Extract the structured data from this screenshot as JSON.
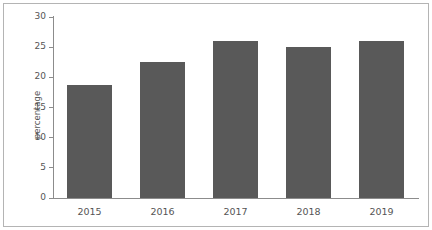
{
  "chart_data": {
    "type": "bar",
    "title": "",
    "subtitle": "",
    "xlabel": "",
    "ylabel": "percentage",
    "categories": [
      "2015",
      "2016",
      "2017",
      "2018",
      "2019"
    ],
    "values": [
      18.8,
      22.6,
      26.0,
      25.1,
      26.0
    ],
    "series": [
      {
        "name": "percentage",
        "values": [
          18.8,
          22.6,
          26.0,
          25.1,
          26.0
        ]
      }
    ],
    "ylim": [
      0,
      30
    ],
    "yticks": [
      0,
      5,
      10,
      15,
      20,
      25,
      30
    ],
    "ytick_labels": [
      "0",
      "5",
      "10",
      "15",
      "20",
      "25",
      "30"
    ],
    "xtick_labels": [
      "2015",
      "2016",
      "2017",
      "2018",
      "2019"
    ],
    "grid": false,
    "legend": null,
    "legend_position": "none",
    "bar_color": "#595959",
    "axis_color": "#8c8c8c",
    "tick_label_color": "#555555",
    "background_color": "#ffffff",
    "border_color": "#b4b4b4",
    "annotations": []
  }
}
